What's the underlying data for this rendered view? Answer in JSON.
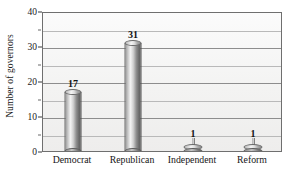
{
  "chart_data": {
    "type": "bar",
    "title": "",
    "xlabel": "",
    "ylabel": "Number of governors",
    "categories": [
      "Democrat",
      "Republican",
      "Independent",
      "Reform"
    ],
    "values": [
      17,
      31,
      1,
      1
    ],
    "data_labels": [
      "17",
      "31",
      "1",
      "1"
    ],
    "ylim": [
      0,
      40
    ],
    "y_major_ticks": [
      0,
      10,
      20,
      30,
      40
    ],
    "y_tick_labels": [
      "0",
      "10",
      "20",
      "30",
      "40"
    ],
    "y_minor_ticks": [
      5,
      15,
      25,
      35
    ],
    "gridlines": [
      5,
      10,
      15,
      20,
      25,
      30,
      35,
      40
    ],
    "grid": true,
    "legend": null,
    "style": {
      "bar_style": "3d-cylinder",
      "bar_fill_light": "#f2f2f2",
      "bar_fill_dark": "#5e5e5e",
      "plot_background": "#f3f3f2",
      "gridline_color": "#8d8d8d",
      "axis_color": "#6f6f6f",
      "text_color": "#1a1a1a"
    }
  }
}
